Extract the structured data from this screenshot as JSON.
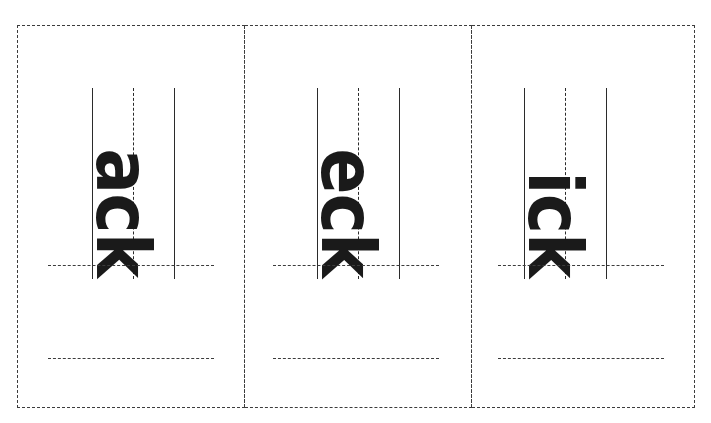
{
  "worksheet": {
    "title": "Word Family Rime Handwriting Practice",
    "colors": {
      "ink": "#1a1a1a",
      "guide_line": "#2b2b2b",
      "dashed_border": "#3c3c3c",
      "background": "#ffffff"
    },
    "layout": {
      "columns": 3,
      "rows": 1,
      "text_orientation": "rotated-90-ccw",
      "guideline_style": "solid-top, dashed-mid, solid-baseline",
      "practice_lines_per_card": 2
    },
    "cards": [
      {
        "id": "card-1",
        "rime": "ack",
        "practice_lines": [
          "",
          ""
        ]
      },
      {
        "id": "card-2",
        "rime": "eck",
        "practice_lines": [
          "",
          ""
        ]
      },
      {
        "id": "card-3",
        "rime": "ick",
        "practice_lines": [
          "",
          ""
        ]
      }
    ]
  }
}
